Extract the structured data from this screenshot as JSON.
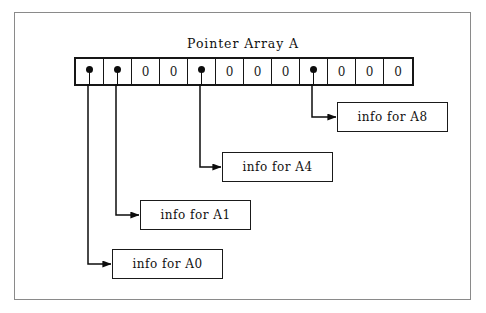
{
  "diagram": {
    "title": "Pointer Array A",
    "array_name": "A",
    "null_symbol": "0",
    "cells": [
      {
        "index": 0,
        "kind": "pointer",
        "label": ""
      },
      {
        "index": 1,
        "kind": "pointer",
        "label": ""
      },
      {
        "index": 2,
        "kind": "null",
        "label": "0"
      },
      {
        "index": 3,
        "kind": "null",
        "label": "0"
      },
      {
        "index": 4,
        "kind": "pointer",
        "label": ""
      },
      {
        "index": 5,
        "kind": "null",
        "label": "0"
      },
      {
        "index": 6,
        "kind": "null",
        "label": "0"
      },
      {
        "index": 7,
        "kind": "null",
        "label": "0"
      },
      {
        "index": 8,
        "kind": "pointer",
        "label": ""
      },
      {
        "index": 9,
        "kind": "null",
        "label": "0"
      },
      {
        "index": 10,
        "kind": "null",
        "label": "0"
      },
      {
        "index": 11,
        "kind": "null",
        "label": "0"
      }
    ],
    "info_boxes": [
      {
        "id": "a8",
        "label": "info  for A8",
        "from_cell": 8
      },
      {
        "id": "a4",
        "label": "info for A4",
        "from_cell": 4
      },
      {
        "id": "a1",
        "label": "info for A1",
        "from_cell": 1
      },
      {
        "id": "a0",
        "label": "info for A0",
        "from_cell": 0
      }
    ],
    "colors": {
      "ink": "#161616",
      "frame": "#8a8a8a",
      "background": "#ffffff"
    }
  }
}
